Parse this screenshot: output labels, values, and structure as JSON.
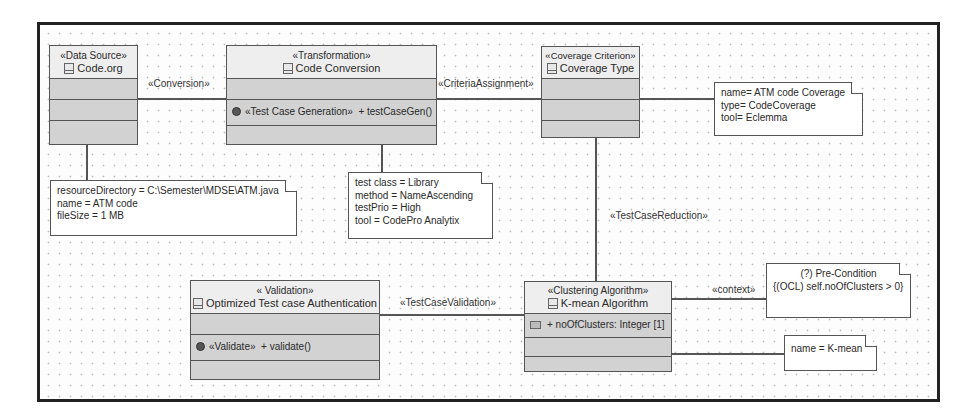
{
  "diagram": {
    "classes": {
      "data_source": {
        "stereotype": "«Data Source»",
        "name": "Code.org"
      },
      "transformation": {
        "stereotype": "«Transformation»",
        "name": "Code Conversion",
        "operation_stereotype": "«Test Case Generation»",
        "operation": "+ testCaseGen()"
      },
      "coverage": {
        "stereotype": "«Coverage Criterion»",
        "name": "Coverage Type"
      },
      "validation": {
        "stereotype": "« Validation»",
        "name": "Optimized Test case Authentication",
        "operation_stereotype": "«Validate»",
        "operation": "+ validate()"
      },
      "clustering": {
        "stereotype": "«Clustering Algorithm»",
        "name": "K-mean Algorithm",
        "attribute": "+ noOfClusters: Integer [1]"
      }
    },
    "associations": {
      "conversion": "«Conversion»",
      "criteria_assignment": "«CriteriaAssignment»",
      "test_case_reduction": "«TestCaseReduction»",
      "test_case_validation": "«TestCaseValidation»",
      "context": "«context»"
    },
    "notes": {
      "data_source_note": [
        "resourceDirectory = C:\\Semester\\MDSE\\ATM.java",
        "name = ATM code",
        "fileSize = 1 MB"
      ],
      "transformation_note": [
        "test class = Library",
        "method = NameAscending",
        "testPrio = High",
        "tool = CodePro Analytix"
      ],
      "coverage_note": [
        "name= ATM code Coverage",
        "type= CodeCoverage",
        "tool= Eclemma"
      ],
      "precondition_note": [
        "(?) Pre-Condition",
        "{(OCL)  self.noOfClusters > 0}"
      ],
      "kmean_note": [
        "name = K-mean"
      ]
    }
  }
}
